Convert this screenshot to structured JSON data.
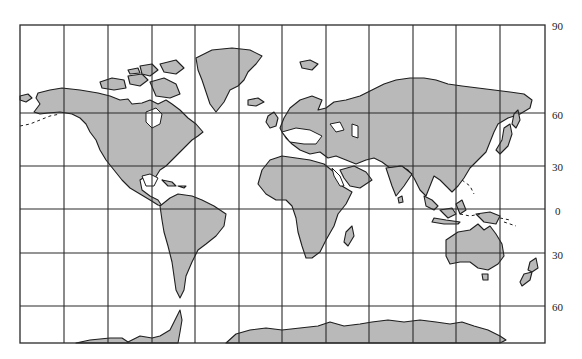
{
  "map": {
    "projection": "Mercator",
    "colors": {
      "land": "#b9b9b9",
      "water": "#ffffff",
      "outline": "#1e1e1e",
      "grid": "#2a2a2a"
    },
    "frame": {
      "left": 20,
      "top": 25,
      "right": 545,
      "bottom": 343
    },
    "meridians_x": [
      20,
      64,
      108,
      152,
      195,
      239,
      282,
      326,
      369,
      413,
      456,
      500,
      545
    ],
    "parallels": [
      {
        "label": "90",
        "y": 25,
        "label_y": 22
      },
      {
        "label": "60",
        "y": 113,
        "label_y": 111
      },
      {
        "label": "30",
        "y": 166,
        "label_y": 163
      },
      {
        "label": "0",
        "y": 209,
        "label_y": 207
      },
      {
        "label": "30",
        "y": 253,
        "label_y": 251
      },
      {
        "label": "60",
        "y": 306,
        "label_y": 303
      }
    ],
    "landmasses": [
      "North America",
      "Greenland",
      "Canadian Arctic Archipelago",
      "South America",
      "Europe",
      "Africa",
      "Asia",
      "Australia",
      "New Zealand",
      "Antarctica",
      "Madagascar",
      "Japan",
      "Indonesia",
      "Iceland",
      "British Isles"
    ]
  }
}
